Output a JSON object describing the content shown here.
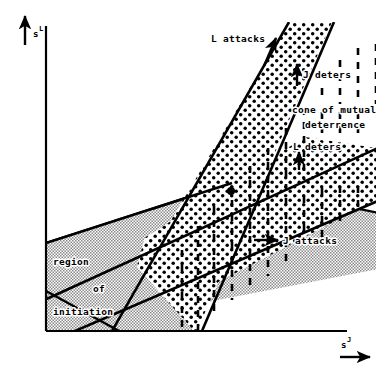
{
  "figure": {
    "kind": "strategy-space-deterrence-diagram",
    "background_color": "#ffffff",
    "ink_color": "#000000"
  },
  "axes": {
    "x": {
      "label": "s",
      "superscript": "J",
      "arrow": "right-arrow-icon"
    },
    "y": {
      "label": "s",
      "superscript": "L",
      "arrow": "up-arrow-icon"
    }
  },
  "annotations": [
    {
      "id": "l-attacks",
      "text": "L attacks",
      "arrow": "up-right-arrow-icon"
    },
    {
      "id": "j-deters",
      "text": "J deters",
      "arrow": "up-arrow-icon"
    },
    {
      "id": "cone-line1",
      "text": "cone of mutual",
      "arrow": "none"
    },
    {
      "id": "cone-line2",
      "text": "deterrence",
      "arrow": "none"
    },
    {
      "id": "l-deters",
      "text": "L deters",
      "arrow": "up-arrow-icon"
    },
    {
      "id": "j-attacks",
      "text": "J attacks",
      "arrow": "right-arrow-icon"
    },
    {
      "id": "region-line1",
      "text": "region",
      "arrow": "none"
    },
    {
      "id": "region-line2",
      "text": "of",
      "arrow": "none"
    },
    {
      "id": "region-line3",
      "text": "initiation",
      "arrow": "none"
    }
  ],
  "regions": {
    "dotted_band": {
      "name": "mutual-deterrence-dotted-band",
      "fill": "dots"
    },
    "gray_band": {
      "name": "region-of-initiation-gray-band",
      "fill": "gray-stipple"
    }
  },
  "markers": [
    {
      "name": "equilibrium-point",
      "shape": "filled-circle"
    }
  ],
  "colors": {
    "ink": "#000000",
    "paper": "#ffffff",
    "gray_fill": "#b8b8b8"
  }
}
